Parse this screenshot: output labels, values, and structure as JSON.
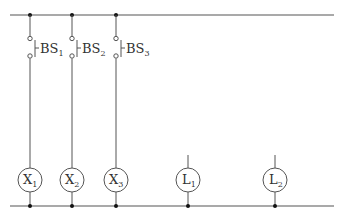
{
  "diagram": {
    "type": "ladder-circuit",
    "top_rail": {
      "y": 15,
      "x1": 10,
      "x2": 334
    },
    "bottom_rail": {
      "y": 206,
      "x1": 10,
      "x2": 334
    },
    "switches": [
      {
        "id": "BS1",
        "label": "BS",
        "sub": "1",
        "x": 30
      },
      {
        "id": "BS2",
        "label": "BS",
        "sub": "2",
        "x": 72
      },
      {
        "id": "BS3",
        "label": "BS",
        "sub": "3",
        "x": 116
      }
    ],
    "relays": [
      {
        "id": "X1",
        "label": "X",
        "sub": "1",
        "x": 30
      },
      {
        "id": "X2",
        "label": "X",
        "sub": "2",
        "x": 72
      },
      {
        "id": "X3",
        "label": "X",
        "sub": "3",
        "x": 116
      }
    ],
    "lamps": [
      {
        "id": "L1",
        "label": "L",
        "sub": "1",
        "x": 188
      },
      {
        "id": "L2",
        "label": "L",
        "sub": "2",
        "x": 275
      }
    ],
    "colors": {
      "line": "#555555",
      "dot": "#111111"
    }
  }
}
